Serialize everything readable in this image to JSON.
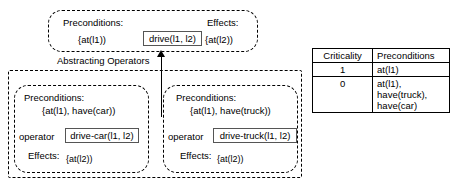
{
  "diagram": {
    "abstract_operator": {
      "preconditions_label": "Preconditions:",
      "preconditions_value": "{at(l1))",
      "effects_label": "Effects:",
      "effects_value": "{at(l2))",
      "operator_name": "drive(l1, l2)"
    },
    "transition_caption": "Abstracting Operators",
    "ground_operators": [
      {
        "preconditions_label": "Preconditions:",
        "preconditions_value": "{at(l1), have(car))",
        "operator_label": "operator",
        "operator_name": "drive-car(l1, l2)",
        "effects_label": "Effects:",
        "effects_value": "{at(l2))"
      },
      {
        "preconditions_label": "Preconditions:",
        "preconditions_value": "{at(l1), have(truck))",
        "operator_label": "operator",
        "operator_name": "drive-truck(l1, l2)",
        "effects_label": "Effects:",
        "effects_value": "{at(l2))"
      }
    ]
  },
  "criticality_table": {
    "headers": [
      "Criticality",
      "Preconditions"
    ],
    "rows": [
      {
        "criticality": "1",
        "preconditions": "at(l1)"
      },
      {
        "criticality": "0",
        "preconditions": "at(l1), have(truck), have(car)"
      }
    ]
  },
  "colors": {
    "stroke": "#000000",
    "chip_border": "#555555",
    "background": "#ffffff"
  }
}
